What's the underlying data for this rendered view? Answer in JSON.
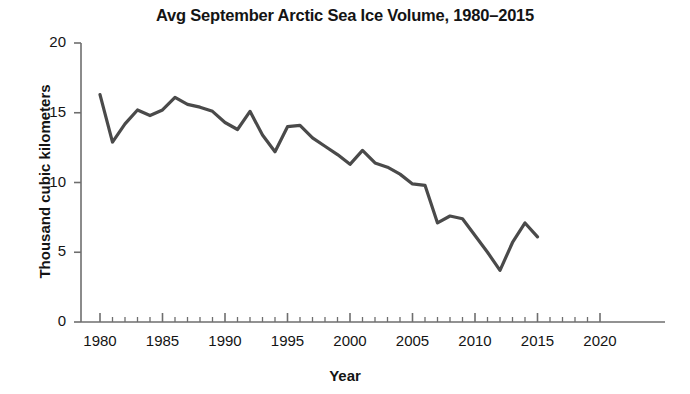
{
  "chart_data": {
    "type": "line",
    "title": "Avg September Arctic Sea Ice Volume, 1980–2015",
    "xlabel": "Year",
    "ylabel": "Thousand cubic kilometers",
    "xlim": [
      1980,
      2020
    ],
    "ylim": [
      0,
      20
    ],
    "xticks": [
      1980,
      1985,
      1990,
      1995,
      2000,
      2005,
      2010,
      2015,
      2020
    ],
    "xtick_labels": [
      "1980",
      "1985",
      "1990",
      "1995",
      "2000",
      "2005",
      "2010",
      "2015",
      "2020"
    ],
    "yticks": [
      0,
      5,
      10,
      15,
      20
    ],
    "ytick_labels": [
      "0",
      "5",
      "10",
      "15",
      "20"
    ],
    "x_minor_tick_interval": 1,
    "grid": false,
    "legend": false,
    "line_color": "#4a4a4a",
    "line_width": 3.2,
    "x": [
      1980,
      1981,
      1982,
      1983,
      1984,
      1985,
      1986,
      1987,
      1988,
      1989,
      1990,
      1991,
      1992,
      1993,
      1994,
      1995,
      1996,
      1997,
      1998,
      1999,
      2000,
      2001,
      2002,
      2003,
      2004,
      2005,
      2006,
      2007,
      2008,
      2009,
      2010,
      2011,
      2012,
      2013,
      2014,
      2015
    ],
    "values": [
      16.3,
      12.9,
      14.2,
      15.2,
      14.8,
      15.2,
      16.1,
      15.6,
      15.4,
      15.1,
      14.3,
      13.8,
      15.1,
      13.4,
      12.2,
      14.0,
      14.1,
      13.2,
      12.6,
      12.0,
      11.3,
      12.3,
      11.4,
      11.1,
      10.6,
      9.9,
      9.8,
      7.1,
      7.6,
      7.4,
      6.2,
      5.0,
      3.7,
      5.7,
      7.1,
      6.1
    ],
    "xlabel_positions": {
      "x_origin_px": 100,
      "px_per_year": 12.5
    }
  }
}
